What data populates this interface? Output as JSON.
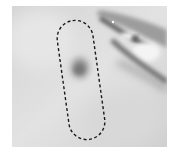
{
  "image": {
    "kind": "grayscale skin photograph",
    "background_color": "#ffffff",
    "skin_tone": "#d9d9d9",
    "lesion_color": "#8a8a8a",
    "outline": {
      "style": "dashed",
      "color": "#1a1a1a",
      "shape": "rounded-rectangle (stadium)"
    }
  }
}
